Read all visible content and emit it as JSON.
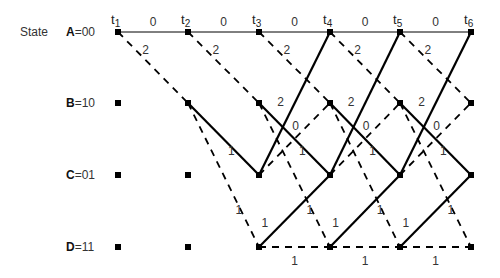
{
  "title_label": "State",
  "states": [
    {
      "id": "A",
      "name": "A",
      "code": "=00",
      "y": 32
    },
    {
      "id": "B",
      "name": "B",
      "code": "=10",
      "y": 103
    },
    {
      "id": "C",
      "name": "C",
      "code": "=01",
      "y": 175
    },
    {
      "id": "D",
      "name": "D",
      "code": "=11",
      "y": 247
    }
  ],
  "times": [
    {
      "label": "t",
      "sub": "1",
      "x": 118
    },
    {
      "label": "t",
      "sub": "2",
      "x": 188
    },
    {
      "label": "t",
      "sub": "3",
      "x": 259
    },
    {
      "label": "t",
      "sub": "4",
      "x": 330
    },
    {
      "label": "t",
      "sub": "5",
      "x": 400
    },
    {
      "label": "t",
      "sub": "6",
      "x": 471
    }
  ],
  "legend": {
    "solid": "input bit 0",
    "dashed": "input bit 1"
  },
  "edge_types": [
    {
      "from": "A",
      "to": "A",
      "style": "solid-thin",
      "label": "0"
    },
    {
      "from": "A",
      "to": "B",
      "style": "dashed",
      "label": "2"
    },
    {
      "from": "B",
      "to": "C",
      "style": "solid",
      "label": "1"
    },
    {
      "from": "B",
      "to": "D",
      "style": "dashed",
      "label": "1"
    },
    {
      "from": "C",
      "to": "A",
      "style": "solid",
      "label": "2"
    },
    {
      "from": "C",
      "to": "B",
      "style": "dashed",
      "label": "0"
    },
    {
      "from": "D",
      "to": "C",
      "style": "solid",
      "label": "1"
    },
    {
      "from": "D",
      "to": "D",
      "style": "dashed",
      "label": "1"
    }
  ],
  "reachable": {
    "0": [
      "A"
    ],
    "1": [
      "A",
      "B"
    ],
    "2": [
      "A",
      "B",
      "C",
      "D"
    ],
    "3": [
      "A",
      "B",
      "C",
      "D"
    ],
    "4": [
      "A",
      "B",
      "C",
      "D"
    ],
    "5": [
      "A",
      "B",
      "C",
      "D"
    ]
  }
}
